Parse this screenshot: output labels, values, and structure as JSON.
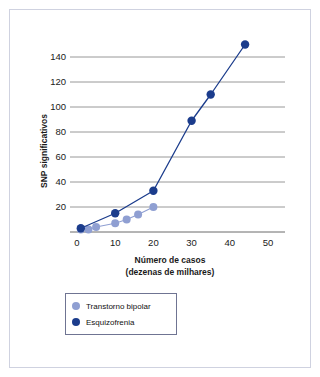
{
  "chart_data": {
    "type": "line",
    "title": "",
    "subtitle": "",
    "xlabel": "Número de casos",
    "xlabel_line2": "(dezenas de milhares)",
    "ylabel": "SNP significativos",
    "xlim": [
      0,
      55
    ],
    "ylim": [
      0,
      152
    ],
    "xticks": [
      0,
      10,
      20,
      30,
      40,
      50
    ],
    "xtick_labels": [
      "0",
      "10",
      "20",
      "30",
      "40",
      "50"
    ],
    "yticks": [
      20,
      40,
      60,
      80,
      100,
      120,
      140
    ],
    "ytick_labels": [
      "20",
      "40",
      "60",
      "80",
      "100",
      "120",
      "140"
    ],
    "grid": "horizontal",
    "legend_position": "below-axis-left",
    "series": [
      {
        "name": "Transtorno bipolar",
        "color": "#8f9fd2",
        "x": [
          1,
          3,
          5,
          10,
          13,
          16,
          20
        ],
        "y": [
          2,
          2,
          4,
          7,
          10,
          14,
          20
        ]
      },
      {
        "name": "Esquizofrenia",
        "color": "#1b3c8c",
        "x": [
          1,
          10,
          20,
          30,
          35,
          44
        ],
        "y": [
          3,
          15,
          33,
          89,
          110,
          150
        ]
      }
    ]
  },
  "legend": {
    "items": [
      {
        "label": "Transtorno bipolar",
        "color": "#8f9fd2"
      },
      {
        "label": "Esquizofrenia",
        "color": "#1b3c8c"
      }
    ]
  },
  "colors": {
    "bipolar": "#8f9fd2",
    "schizophrenia": "#1b3c8c",
    "gridline": "#8d8d8d",
    "axis": "#6a6a6a",
    "frame": "#cfd2e0",
    "text": "#1a1a1a",
    "background": "#ffffff"
  }
}
